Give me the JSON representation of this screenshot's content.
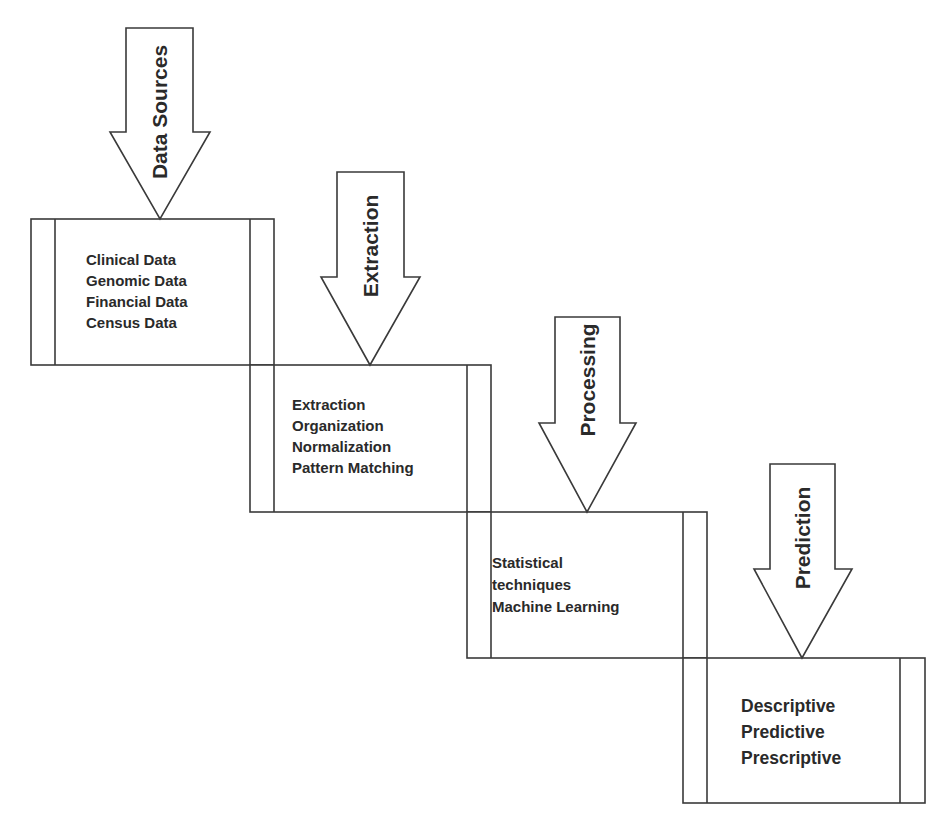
{
  "diagram": {
    "type": "process-flow",
    "stages": [
      {
        "arrow_label": "Data Sources",
        "box_items": [
          "Clinical Data",
          "Genomic Data",
          "Financial Data",
          "Census Data"
        ]
      },
      {
        "arrow_label": "Extraction",
        "box_items": [
          "Extraction",
          "Organization",
          "Normalization",
          "Pattern Matching"
        ]
      },
      {
        "arrow_label": "Processing",
        "box_items": [
          "Statistical",
          "techniques",
          "Machine Learning"
        ]
      },
      {
        "arrow_label": "Prediction",
        "box_items": [
          "Descriptive",
          "Predictive",
          "Prescriptive"
        ]
      }
    ],
    "colors": {
      "background": "#ffffff",
      "stroke": "#3a3a3a",
      "text": "#2a2a2a"
    }
  }
}
